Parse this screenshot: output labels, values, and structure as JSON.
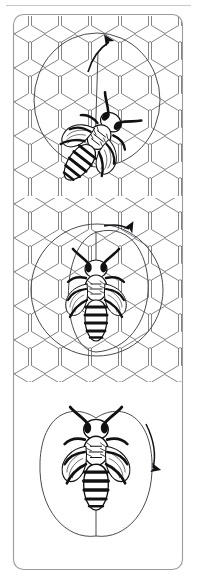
{
  "figure": {
    "background_color": "#ffffff",
    "ink_color": "#1a1a1a",
    "comb_line_color": "#6e6e73",
    "path_line_color": "#4a4a4f",
    "frame_color": "#9a9a9f",
    "width": 197,
    "height": 578
  },
  "top_rule": {
    "name": "top-hairline",
    "y": 5,
    "x1": 6,
    "x2": 191,
    "color": "#c9c9cd"
  },
  "frame": {
    "name": "illustration-frame",
    "x": 13,
    "y": 14,
    "width": 170,
    "height": 556,
    "corner_radius": 10,
    "stroke_width": 1
  },
  "panels": [
    {
      "id": "panel-1",
      "label": "Waggle run tilted from vertical",
      "order": 1,
      "y_top": 16,
      "y_bottom": 196,
      "has_honeycomb": true,
      "bee": {
        "name": "bee-tilted",
        "center_x": 93,
        "center_y": 145,
        "rotation_deg": 38,
        "scale": 1.0,
        "orientation": "head up-right, abdomen down-left"
      },
      "dance_path": {
        "type": "ellipse-loop",
        "center_x": 97,
        "center_y": 100,
        "radius_x": 63,
        "radius_y": 67,
        "rotation_deg": 0
      },
      "waggle_run": {
        "type": "straight-line",
        "x1": 95,
        "y1": 145,
        "x2": 99,
        "y2": 46,
        "arrow": "up",
        "arrow_x": 107,
        "arrow_y": 44
      }
    },
    {
      "id": "panel-2",
      "label": "Waggle run straight up with return loop",
      "order": 2,
      "y_top": 200,
      "y_bottom": 380,
      "has_honeycomb": true,
      "bee": {
        "name": "bee-upright",
        "center_x": 96,
        "center_y": 298,
        "rotation_deg": 0,
        "scale": 1.0,
        "orientation": "head up, abdomen down"
      },
      "dance_path": {
        "type": "ellipse-loop",
        "center_x": 97,
        "center_y": 290,
        "radius_x": 66,
        "radius_y": 66,
        "rotation_deg": 0
      },
      "return_loop": {
        "type": "inner-right-loop",
        "center_x": 118,
        "center_y": 288,
        "radius_x": 38,
        "radius_y": 58
      },
      "waggle_run": {
        "type": "straight-line",
        "x1": 96,
        "y1": 300,
        "x2": 96,
        "y2": 228,
        "arrow": "right",
        "arrow_x": 131,
        "arrow_y": 230
      }
    },
    {
      "id": "panel-3",
      "label": "Complete figure-eight dance circuit",
      "order": 3,
      "y_top": 392,
      "y_bottom": 566,
      "has_honeycomb": false,
      "bee": {
        "name": "bee-upright-large",
        "center_x": 96,
        "center_y": 462,
        "rotation_deg": 0,
        "scale": 1.12,
        "orientation": "head up, abdomen down"
      },
      "dance_path": {
        "type": "figure-eight",
        "left_lobe": {
          "center_x": 71,
          "center_y": 470,
          "radius_x": 33,
          "radius_y": 63
        },
        "right_lobe": {
          "center_x": 122,
          "center_y": 470,
          "radius_x": 33,
          "radius_y": 63
        }
      },
      "waggle_run": {
        "type": "straight-line",
        "x1": 96,
        "y1": 488,
        "x2": 96,
        "y2": 535,
        "arrow": "down",
        "arrow_x": 152,
        "arrow_y": 470
      }
    }
  ],
  "honeycomb": {
    "name": "honeycomb-background",
    "cell_width": 30,
    "cell_height": 34,
    "orientation": "pointy-top",
    "regions": [
      {
        "panel": "panel-1",
        "y_top": 16,
        "y_bottom": 196
      },
      {
        "panel": "panel-2",
        "y_top": 198,
        "y_bottom": 382
      }
    ]
  },
  "arrows": [
    {
      "name": "arrow-panel-1",
      "panel": "panel-1",
      "direction": "up",
      "x": 107,
      "y": 44
    },
    {
      "name": "arrow-panel-2",
      "panel": "panel-2",
      "direction": "right",
      "x": 131,
      "y": 230
    },
    {
      "name": "arrow-panel-3",
      "panel": "panel-3",
      "direction": "down",
      "x": 152,
      "y": 470
    }
  ]
}
